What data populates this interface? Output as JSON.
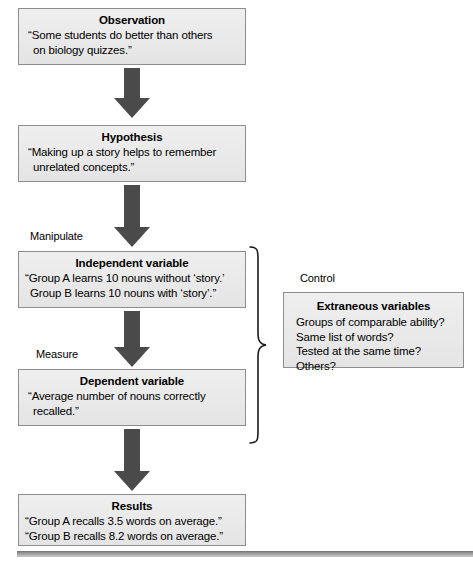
{
  "diagram": {
    "accent_box_fill": "#e9e9e9",
    "accent_box_border": "#8d8d8d",
    "arrow_color": "#4a4a4a",
    "brace_color": "#1a1a1a",
    "bottom_bar_color": "#8a8a8a"
  },
  "steps": [
    {
      "key": "observation",
      "title": "Observation",
      "lines": [
        "“Some students do better than others",
        "on biology quizzes.”"
      ]
    },
    {
      "key": "hypothesis",
      "title": "Hypothesis",
      "lines": [
        "“Making up a story helps to remember",
        "unrelated concepts.”"
      ]
    },
    {
      "key": "independent-variable",
      "title": "Independent variable",
      "lines": [
        "“Group A learns 10 nouns without ‘story.’",
        "Group B learns 10 nouns with ‘story’.”"
      ]
    },
    {
      "key": "dependent-variable",
      "title": "Dependent variable",
      "lines": [
        "“Average number of nouns correctly",
        "recalled.”"
      ]
    },
    {
      "key": "results",
      "title": "Results",
      "lines": [
        "“Group A recalls 3.5 words on average.”",
        "“Group B recalls 8.2 words on average.”"
      ]
    }
  ],
  "side_labels": {
    "manipulate": "Manipulate",
    "measure": "Measure",
    "control": "Control"
  },
  "extraneous": {
    "title": "Extraneous variables",
    "lines": [
      "Groups of comparable ability?",
      "Same list of words?",
      "Tested at the same time?",
      "Others?"
    ]
  }
}
